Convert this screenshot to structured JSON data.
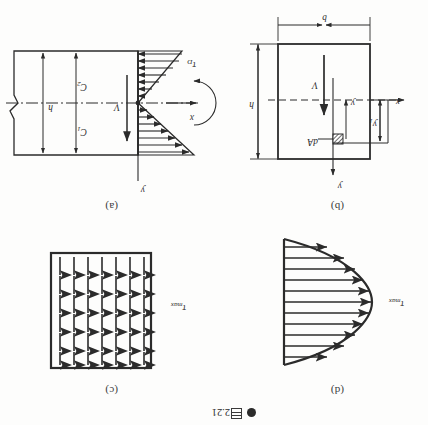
{
  "figure": {
    "caption_bullet": "●",
    "caption_cjk": "图",
    "caption_number": "2.21",
    "caption_full": "● 图 2.21",
    "orientation": "rotated-180",
    "ink_color": "#2b2b2b",
    "paper_color": "#fdfdfc"
  },
  "panels": [
    {
      "id": "a",
      "label": "(a)",
      "title": "bending stress distribution on cross section",
      "labels": {
        "axis_y": "y",
        "axis_x": "x",
        "shear_resultant": "V",
        "stress": "τ",
        "stress_sub": "D",
        "centroid_upper": "C",
        "centroid_upper_sub": "1",
        "centroid_lower": "C",
        "centroid_lower_sub": "2",
        "height": "h"
      }
    },
    {
      "id": "b",
      "label": "(b)",
      "title": "rectangular cross section with element dA",
      "labels": {
        "axis_y": "y",
        "axis_x": "x",
        "shear_resultant": "V",
        "element": "dA",
        "ordinate": "y",
        "ordinate_sub": "1",
        "ordinate2": "y",
        "width": "b",
        "height": "h"
      }
    },
    {
      "id": "c",
      "label": "(c)",
      "title": "uniform shear arrows over rectangle",
      "labels": {
        "tau_max": "τ",
        "tau_max_sub": "max"
      },
      "arrow_grid": {
        "cols": 7,
        "rows": 6
      }
    },
    {
      "id": "d",
      "label": "(d)",
      "title": "parabolic shear stress distribution",
      "labels": {
        "tau_max": "τ",
        "tau_max_sub": "max"
      },
      "arrow_count": 11
    }
  ]
}
